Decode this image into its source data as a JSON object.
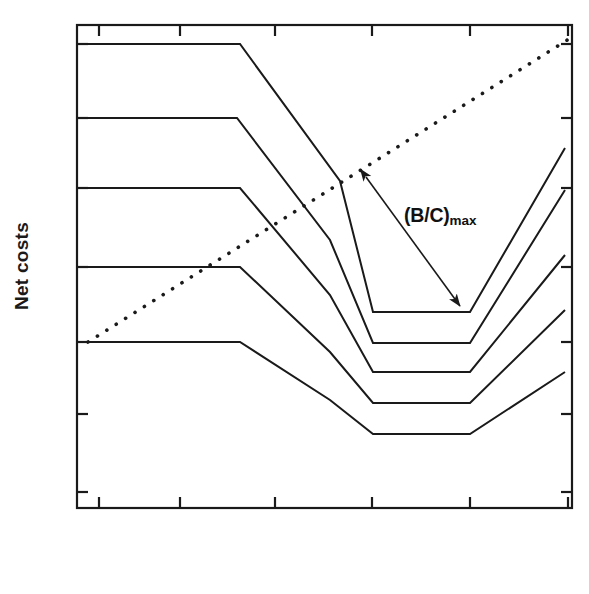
{
  "figure": {
    "axis_labels": {
      "y": "Net costs",
      "x": ""
    },
    "annotations": [
      {
        "id": "bc-max",
        "text_main": "(B/C)",
        "text_sub": "max",
        "x": 404,
        "y": 204
      }
    ],
    "colors": {
      "axis": "#1a1a1a",
      "curve": "#1a1a1a",
      "dotted": "#1a1a1a",
      "arrow": "#1a1a1a",
      "background": "#ffffff"
    }
  },
  "chart_data": {
    "type": "line",
    "title": "",
    "xlabel": "",
    "ylabel": "Net costs",
    "grid": false,
    "legend": null,
    "axis": {
      "frame": {
        "left": 77,
        "top": 25,
        "right": 572,
        "bottom": 508
      },
      "x_ticks_px": [
        99,
        180,
        275,
        372,
        470,
        568
      ],
      "y_ticks_px": [
        44,
        118,
        188,
        267,
        342,
        414,
        492
      ],
      "x_tick_labels": [],
      "y_tick_labels": [],
      "ticks_inward": true
    },
    "series": [
      {
        "name": "curve-1",
        "points_px": [
          [
            88,
            44
          ],
          [
            240,
            44
          ],
          [
            340,
            181
          ],
          [
            373,
            312
          ],
          [
            470,
            312
          ],
          [
            565,
            148
          ]
        ]
      },
      {
        "name": "curve-2",
        "points_px": [
          [
            88,
            118
          ],
          [
            237,
            118
          ],
          [
            330,
            240
          ],
          [
            373,
            343
          ],
          [
            470,
            343
          ],
          [
            565,
            190
          ]
        ]
      },
      {
        "name": "curve-3",
        "points_px": [
          [
            88,
            188
          ],
          [
            240,
            188
          ],
          [
            330,
            295
          ],
          [
            373,
            372
          ],
          [
            470,
            372
          ],
          [
            565,
            255
          ]
        ]
      },
      {
        "name": "curve-4",
        "points_px": [
          [
            88,
            267
          ],
          [
            240,
            267
          ],
          [
            330,
            352
          ],
          [
            373,
            403
          ],
          [
            470,
            403
          ],
          [
            565,
            310
          ]
        ]
      },
      {
        "name": "curve-5",
        "points_px": [
          [
            88,
            342
          ],
          [
            240,
            342
          ],
          [
            330,
            400
          ],
          [
            373,
            434
          ],
          [
            470,
            434
          ],
          [
            565,
            372
          ]
        ]
      },
      {
        "name": "benefit-line-dotted",
        "style": "dotted",
        "points_px": [
          [
            88,
            342
          ],
          [
            572,
            37
          ]
        ]
      }
    ],
    "arrow": {
      "name": "bc-max-arrow",
      "from_px": [
        366,
        177
      ],
      "to_px": [
        460,
        306
      ],
      "double_headed": true
    }
  }
}
